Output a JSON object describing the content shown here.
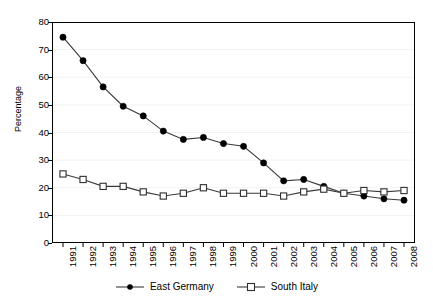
{
  "chart_data": {
    "type": "line",
    "title": "",
    "xlabel": "",
    "ylabel": "Percentage",
    "ylim": [
      0,
      80
    ],
    "ytick_step": 10,
    "yticks": [
      80,
      70,
      60,
      50,
      40,
      30,
      20,
      10,
      0
    ],
    "grid": true,
    "grid_axis": "y",
    "legend_position": "bottom-center",
    "x": [
      "1991",
      "1992",
      "1993",
      "1994",
      "1995",
      "1996",
      "1997",
      "1998",
      "1999",
      "2000",
      "2001",
      "2002",
      "2003",
      "2004",
      "2005",
      "2006",
      "2007",
      "2008"
    ],
    "categories": [
      "1991",
      "1992",
      "1993",
      "1994",
      "1995",
      "1996",
      "1997",
      "1998",
      "1999",
      "2000",
      "2001",
      "2002",
      "2003",
      "2004",
      "2005",
      "2006",
      "2007",
      "2008"
    ],
    "series": [
      {
        "name": "East Germany",
        "marker": "filled-circle",
        "color": "#000000",
        "values": [
          74.5,
          66.0,
          56.5,
          49.5,
          46.0,
          40.5,
          37.5,
          38.2,
          36.0,
          35.0,
          29.0,
          22.5,
          23.0,
          20.5,
          18.0,
          17.0,
          16.0,
          15.5
        ]
      },
      {
        "name": "South Italy",
        "marker": "open-square",
        "color": "#000000",
        "values": [
          25.0,
          23.0,
          20.5,
          20.5,
          18.5,
          17.0,
          18.0,
          20.0,
          18.0,
          18.0,
          18.0,
          17.0,
          18.5,
          19.5,
          18.0,
          19.0,
          18.5,
          19.0
        ]
      }
    ]
  },
  "legend": {
    "items": [
      {
        "label": "East Germany",
        "marker": "filled-circle"
      },
      {
        "label": "South Italy",
        "marker": "open-square"
      }
    ]
  },
  "axis": {
    "y_title": "Percentage"
  },
  "colors": {
    "line": "#3a3a3a",
    "axis": "#000000",
    "grid": "#f2f2f2",
    "background": "#ffffff"
  }
}
